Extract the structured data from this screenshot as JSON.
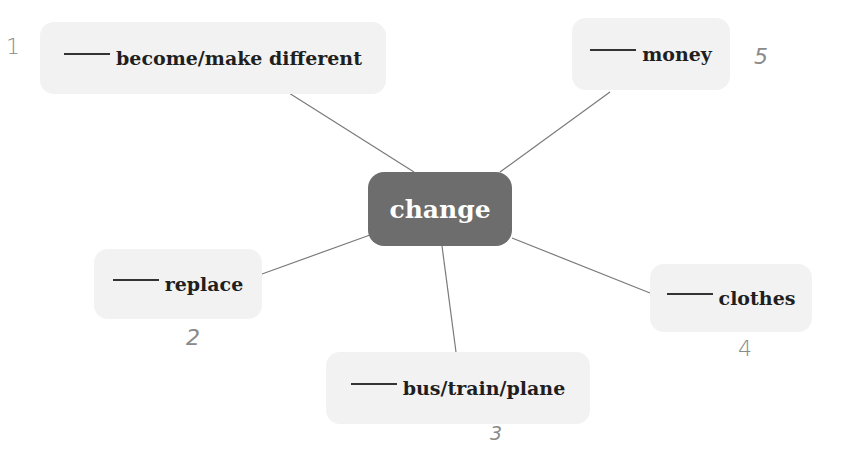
{
  "diagram": {
    "type": "mind-map",
    "center": {
      "label": "change",
      "color": "#6d6d6d"
    },
    "blank": "____",
    "nodes": [
      {
        "id": "become",
        "label": "become/make different",
        "number": "1"
      },
      {
        "id": "replace",
        "label": "replace",
        "number": "2"
      },
      {
        "id": "transport",
        "label": "bus/train/plane",
        "number": "3"
      },
      {
        "id": "clothes",
        "label": "clothes",
        "number": "4"
      },
      {
        "id": "money",
        "label": "money",
        "number": "5"
      }
    ],
    "colors": {
      "node_bg": "#f2f2f2",
      "connector": "#7a7a7a",
      "handwriting": "#8a8a8a"
    }
  }
}
